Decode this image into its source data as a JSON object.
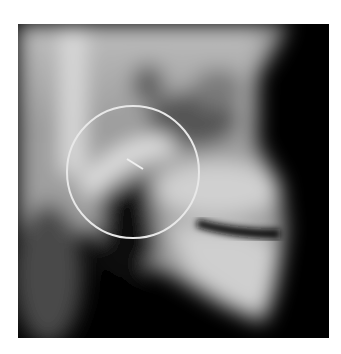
{
  "image": {
    "kind": "lateral skull radiograph",
    "background_color": "#ffffff",
    "film_color": "#000000"
  },
  "annotations": {
    "circle": {
      "cx": 115,
      "cy": 148,
      "r": 66,
      "stroke": "#e8e8e8",
      "stroke_width": 2
    },
    "marker": {
      "x1": 109,
      "y1": 135,
      "x2": 125,
      "y2": 145,
      "stroke": "#f0f0f0",
      "stroke_width": 2
    }
  }
}
